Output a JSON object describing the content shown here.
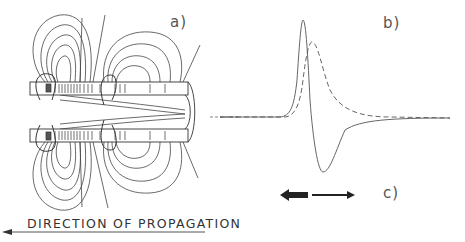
{
  "panels": {
    "a": {
      "label": "a)",
      "description": "Axon with field lines (ion current loops) around propagating action potential"
    },
    "b": {
      "label": "b)",
      "description": "Waveforms: solid biphasic trace and dashed monophasic trace"
    },
    "c": {
      "label": "c)",
      "description": "Current direction arrows"
    }
  },
  "propagation": {
    "text": "DIRECTION OF PROPAGATION",
    "arrow_direction": "left"
  },
  "colors": {
    "line": "#333333",
    "background": "#ffffff"
  }
}
